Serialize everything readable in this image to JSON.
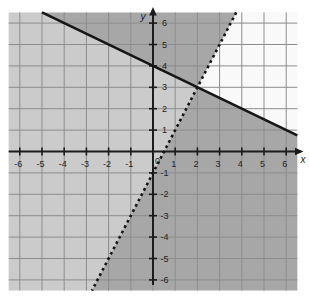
{
  "page": {
    "background": "#ffffff"
  },
  "chart_data": {
    "type": "line",
    "subtype": "linear-inequality-system-graph",
    "title": "",
    "xlabel": "x",
    "ylabel": "y",
    "xlim": [
      -6.5,
      6.5
    ],
    "ylim": [
      -6.5,
      6.5
    ],
    "grid": true,
    "colors": {
      "plot_bg": "#f9f9f9",
      "grid": "#8d8d8d",
      "axis": "#1c1c1c",
      "line": "#161616",
      "label": "#222222",
      "single_shade": "#cbcbcb",
      "double_shade": "#a7a7a7"
    },
    "x_tick_labels": [
      {
        "v": -6,
        "t": "-6"
      },
      {
        "v": -5,
        "t": "-5"
      },
      {
        "v": -4,
        "t": "-4"
      },
      {
        "v": -3,
        "t": "-3"
      },
      {
        "v": -2,
        "t": "-2"
      },
      {
        "v": -1,
        "t": "-1"
      },
      {
        "v": 1,
        "t": "1"
      },
      {
        "v": 2,
        "t": "2"
      },
      {
        "v": 3,
        "t": "3"
      },
      {
        "v": 4,
        "t": "4"
      },
      {
        "v": 5,
        "t": "5"
      },
      {
        "v": 6,
        "t": "6"
      }
    ],
    "y_tick_labels": [
      {
        "v": 6,
        "t": "6"
      },
      {
        "v": 5,
        "t": "5"
      },
      {
        "v": 4,
        "t": "4"
      },
      {
        "v": 3,
        "t": "3"
      },
      {
        "v": 2,
        "t": "2"
      },
      {
        "v": 1,
        "t": "1"
      },
      {
        "v": -1,
        "t": "-1"
      },
      {
        "v": -2,
        "t": "-2"
      },
      {
        "v": -3,
        "t": "-3"
      },
      {
        "v": -4,
        "t": "-4"
      },
      {
        "v": -5,
        "t": "-5"
      },
      {
        "v": -6,
        "t": "-6"
      }
    ],
    "origin_label": "0",
    "boundary_lines": [
      {
        "name": "solid-boundary-line",
        "equation": "y = -1/2x + 4",
        "slope": -0.5,
        "y_intercept": 4,
        "style": "solid",
        "endpoints": [
          [
            -5,
            6.5
          ],
          [
            6.5,
            0.75
          ]
        ]
      },
      {
        "name": "dotted-boundary-line",
        "equation": "y = 2x - 1",
        "slope": 2,
        "y_intercept": -1,
        "style": "dotted",
        "endpoints": [
          [
            3.75,
            6.5
          ],
          [
            -2.75,
            -6.5
          ]
        ]
      }
    ],
    "intersection_point": {
      "x": 2,
      "y": 3
    },
    "shaded_regions": [
      {
        "name": "region-single-shade-left",
        "shade": "single_shade",
        "vertices": [
          [
            -6.5,
            6.5
          ],
          [
            -5,
            6.5
          ],
          [
            2,
            3
          ],
          [
            -2.75,
            -6.5
          ],
          [
            -6.5,
            -6.5
          ]
        ]
      },
      {
        "name": "region-double-shade-upper",
        "shade": "double_shade",
        "vertices": [
          [
            -5,
            6.5
          ],
          [
            3.75,
            6.5
          ],
          [
            2,
            3
          ]
        ]
      },
      {
        "name": "region-double-shade-lower",
        "shade": "double_shade",
        "vertices": [
          [
            2,
            3
          ],
          [
            6.5,
            0.75
          ],
          [
            6.5,
            -6.5
          ],
          [
            -2.75,
            -6.5
          ]
        ]
      }
    ],
    "unshaded_region": {
      "name": "region-unshaded-right",
      "vertices": [
        [
          3.75,
          6.5
        ],
        [
          6.5,
          6.5
        ],
        [
          6.5,
          0.75
        ],
        [
          2,
          3
        ]
      ]
    }
  }
}
